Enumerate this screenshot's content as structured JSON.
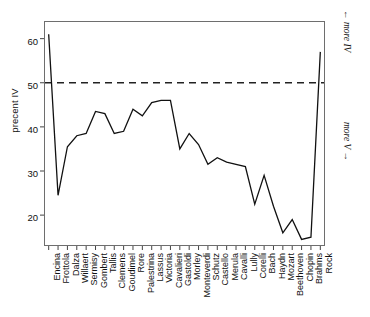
{
  "chart_data": {
    "type": "line",
    "title": "",
    "xlabel": "",
    "ylabel": "precent IV",
    "ylim": [
      13,
      64
    ],
    "yticks": [
      20,
      30,
      40,
      50,
      60
    ],
    "grid": false,
    "legend": "none",
    "reference_line": {
      "value": 50,
      "style": "dashed"
    },
    "annotations": [
      {
        "text": "← more IV",
        "position": "right-upper",
        "rotation": "vertical"
      },
      {
        "text": "more V →",
        "position": "right-lower",
        "rotation": "vertical"
      }
    ],
    "categories": [
      "Encina",
      "Frottola",
      "Dalza",
      "Willaert",
      "Sermisy",
      "Gombert",
      "Tallis",
      "Clemens",
      "Goudimel",
      "Rore",
      "Palestrina",
      "Lassus",
      "Victoria",
      "Cavalieri",
      "Gastoldi",
      "Morley",
      "Monteverdi",
      "Schutz",
      "Castello",
      "Merula",
      "Cavalli",
      "Lully",
      "Corelli",
      "Bach",
      "Haydn",
      "Mozart",
      "Beethoven",
      "Chopin",
      "Brahms",
      "Rock"
    ],
    "values": [
      61,
      24.5,
      35.5,
      38,
      38.5,
      43.5,
      43,
      38.5,
      39,
      44,
      42.5,
      45.5,
      46,
      46,
      35,
      38.5,
      36,
      31.5,
      33,
      32,
      31.5,
      31,
      22.5,
      29,
      22,
      16,
      19,
      14.5,
      15,
      57
    ]
  },
  "axis": {
    "ytick_labels": [
      "60",
      "50",
      "40",
      "30",
      "20"
    ]
  }
}
